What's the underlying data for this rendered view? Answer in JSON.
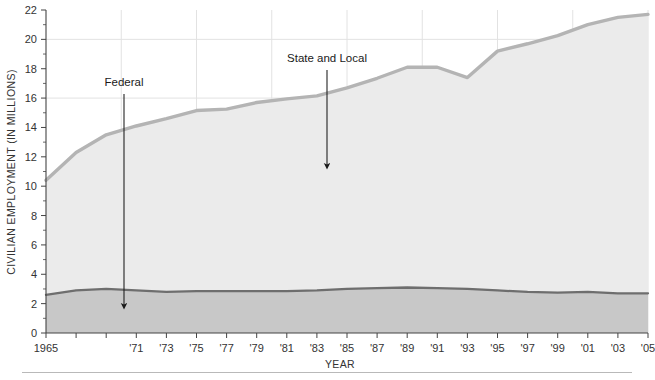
{
  "chart_data": {
    "type": "area",
    "title": "",
    "subtitle": "",
    "xlabel": "YEAR",
    "ylabel": "CIVILIAN EMPLOYMENT (IN MILLIONS)",
    "xlim": [
      1965,
      2005
    ],
    "ylim": [
      0,
      22
    ],
    "ytick_step": 2,
    "yticks": [
      0,
      2,
      4,
      6,
      8,
      10,
      12,
      14,
      16,
      18,
      20,
      22
    ],
    "ytick_labels": [
      "0",
      "2",
      "4",
      "6",
      "8",
      "10",
      "12",
      "14",
      "16",
      "18",
      "20",
      "22"
    ],
    "xticks": [
      1965,
      1967,
      1969,
      1971,
      1973,
      1975,
      1977,
      1979,
      1981,
      1983,
      1985,
      1987,
      1989,
      1991,
      1993,
      1995,
      1997,
      1999,
      2001,
      2003,
      2005
    ],
    "xtick_labels": [
      "1965",
      "",
      "",
      "'71",
      "'73",
      "'75",
      "'77",
      "'79",
      "'81",
      "'83",
      "'85",
      "'87",
      "'89",
      "'91",
      "'93",
      "'95",
      "'97",
      "'99",
      "'01",
      "'03",
      "'05"
    ],
    "grid": true,
    "grid_x_years": [
      1970,
      1975,
      1980,
      1985,
      1990,
      1995,
      2000,
      2005
    ],
    "grid_y_values": [
      10,
      16,
      20
    ],
    "legend": "none",
    "stacked": true,
    "x": [
      1965,
      1967,
      1969,
      1971,
      1973,
      1975,
      1977,
      1979,
      1981,
      1983,
      1985,
      1987,
      1989,
      1991,
      1993,
      1995,
      1997,
      1999,
      2001,
      2003,
      2005
    ],
    "series": [
      {
        "name": "Federal",
        "color": "#c8c8c8",
        "line_color": "#6e6e6e",
        "values": [
          2.6,
          2.9,
          3.0,
          2.9,
          2.8,
          2.85,
          2.85,
          2.85,
          2.85,
          2.9,
          3.0,
          3.05,
          3.1,
          3.05,
          3.0,
          2.9,
          2.8,
          2.75,
          2.8,
          2.7,
          2.7
        ]
      },
      {
        "name": "State and Local",
        "color": "#ebebeb",
        "line_color": "#b4b4b4",
        "values": [
          7.8,
          9.4,
          10.5,
          11.2,
          11.8,
          12.3,
          12.4,
          12.85,
          13.1,
          13.25,
          13.7,
          14.3,
          15.0,
          15.05,
          14.4,
          16.3,
          16.9,
          17.5,
          18.2,
          18.8,
          19.0
        ]
      }
    ],
    "totals": [
      10.4,
      12.3,
      13.5,
      14.1,
      14.6,
      15.15,
      15.25,
      15.7,
      15.95,
      16.15,
      16.7,
      17.35,
      18.1,
      18.1,
      17.4,
      19.2,
      19.7,
      20.25,
      21.0,
      21.5,
      21.7
    ],
    "annotations": [
      {
        "label": "Federal",
        "label_x": 124,
        "label_y": 86,
        "arrow_x": 124,
        "arrow_y_start": 94,
        "arrow_y_end": 306
      },
      {
        "label": "State and Local",
        "label_x": 327,
        "label_y": 62,
        "arrow_x": 327,
        "arrow_y_start": 70,
        "arrow_y_end": 166
      }
    ],
    "colors": {
      "federal_band": "#c8c8c8",
      "state_local_band": "#ebebeb",
      "total_line": "#b4b4b4",
      "federal_line": "#6e6e6e",
      "axis": "#444444",
      "gridline": "#e2e2e2",
      "text": "#333333",
      "annotation": "#1a1a1a",
      "footer_rule": "#b9b9b9"
    }
  }
}
